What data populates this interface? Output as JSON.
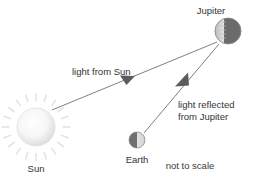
{
  "diagram": {
    "type": "astronomy-ray-diagram",
    "note": "not to scale",
    "colors": {
      "background": "#ffffff",
      "text": "#333333",
      "ray_line": "#7a7a7a",
      "arrowhead": "#5a5a5a",
      "sun_fill_center": "#ffffff",
      "sun_fill_edge": "#dcdcdc",
      "sun_ray": "#e2e2e2",
      "planet_dark": "#6e6e6e",
      "planet_light": "#d9d9d9"
    },
    "bodies": [
      {
        "id": "sun",
        "label": "Sun",
        "cx": 36,
        "cy": 127,
        "r": 19,
        "label_x": 36,
        "label_y": 172
      },
      {
        "id": "earth",
        "label": "Earth",
        "cx": 137,
        "cy": 140,
        "r": 8,
        "label_x": 137,
        "label_y": 163
      },
      {
        "id": "jupiter",
        "label": "Jupiter",
        "cx": 228,
        "cy": 31,
        "r": 13,
        "label_x": 211,
        "label_y": 14
      }
    ],
    "rays": [
      {
        "id": "light-from-sun",
        "label": "light from Sun",
        "from": "sun",
        "to": "jupiter",
        "x1": 52,
        "y1": 110,
        "x2": 217,
        "y2": 42,
        "arrow_x": 127,
        "arrow_y": 80,
        "label_x": 72,
        "label_y": 75
      },
      {
        "id": "light-reflected-from-jupiter",
        "label_line1": "light reflected",
        "label_line2": "from Jupiter",
        "from": "jupiter",
        "to": "earth",
        "x1": 219,
        "y1": 44,
        "x2": 144,
        "y2": 133,
        "arrow_x": 181,
        "arrow_y": 81,
        "label_x": 178,
        "label_y": 108
      }
    ],
    "note_position": {
      "x": 190,
      "y": 169
    }
  }
}
